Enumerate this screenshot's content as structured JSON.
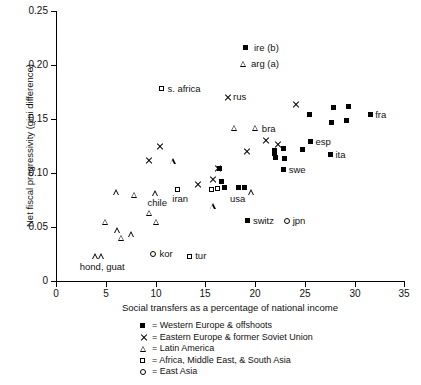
{
  "chart_data": {
    "type": "scatter",
    "title": "",
    "xlabel": "Social transfers as a percentage of national income",
    "ylabel": "Net fiscal progressivity (gini difference)",
    "xlim": [
      0,
      35
    ],
    "ylim": [
      0,
      0.25
    ],
    "xticks": [
      "0",
      "5",
      "10",
      "15",
      "20",
      "25",
      "30",
      "35"
    ],
    "yticks": [
      "0",
      "0.05",
      "0.10",
      "0.15",
      "0.20",
      "0.25"
    ],
    "grid": false,
    "legend_position": "below-axes",
    "series": [
      {
        "name": "Western Europe & offshoots",
        "marker": "filled-square",
        "points": [
          {
            "x": 16.6,
            "y": 0.092,
            "label": ""
          },
          {
            "x": 16.9,
            "y": 0.087,
            "label": ""
          },
          {
            "x": 18.4,
            "y": 0.087,
            "label": "usa"
          },
          {
            "x": 19.0,
            "y": 0.087,
            "label": ""
          },
          {
            "x": 16.4,
            "y": 0.104,
            "label": ""
          },
          {
            "x": 19.3,
            "y": 0.056,
            "label": "switz"
          },
          {
            "x": 22.0,
            "y": 0.118,
            "label": ""
          },
          {
            "x": 22.1,
            "y": 0.114,
            "label": ""
          },
          {
            "x": 22.0,
            "y": 0.121,
            "label": ""
          },
          {
            "x": 23.0,
            "y": 0.113,
            "label": ""
          },
          {
            "x": 22.9,
            "y": 0.123,
            "label": ""
          },
          {
            "x": 25.6,
            "y": 0.129,
            "label": "esp"
          },
          {
            "x": 24.8,
            "y": 0.122,
            "label": ""
          },
          {
            "x": 22.9,
            "y": 0.103,
            "label": "swe"
          },
          {
            "x": 27.6,
            "y": 0.117,
            "label": "ita"
          },
          {
            "x": 25.5,
            "y": 0.154,
            "label": ""
          },
          {
            "x": 27.9,
            "y": 0.161,
            "label": ""
          },
          {
            "x": 29.4,
            "y": 0.162,
            "label": ""
          },
          {
            "x": 27.7,
            "y": 0.147,
            "label": ""
          },
          {
            "x": 29.2,
            "y": 0.149,
            "label": ""
          },
          {
            "x": 31.6,
            "y": 0.154,
            "label": "fra"
          }
        ]
      },
      {
        "name": "Eastern Europe & former Soviet Union",
        "marker": "cross",
        "points": [
          {
            "x": 9.3,
            "y": 0.112,
            "label": ""
          },
          {
            "x": 10.4,
            "y": 0.125,
            "label": ""
          },
          {
            "x": 14.2,
            "y": 0.089,
            "label": ""
          },
          {
            "x": 15.7,
            "y": 0.094,
            "label": ""
          },
          {
            "x": 16.2,
            "y": 0.104,
            "label": ""
          },
          {
            "x": 17.2,
            "y": 0.17,
            "label": "rus"
          },
          {
            "x": 19.2,
            "y": 0.12,
            "label": ""
          },
          {
            "x": 21.1,
            "y": 0.13,
            "label": ""
          },
          {
            "x": 22.3,
            "y": 0.126,
            "label": ""
          },
          {
            "x": 24.1,
            "y": 0.163,
            "label": ""
          }
        ]
      },
      {
        "name": "Latin America",
        "marker": "open-triangle",
        "points": [
          {
            "x": 4.0,
            "y": 0.023,
            "label": "hond, guat"
          },
          {
            "x": 4.6,
            "y": 0.023,
            "label": ""
          },
          {
            "x": 5.0,
            "y": 0.055,
            "label": ""
          },
          {
            "x": 6.2,
            "y": 0.047,
            "label": ""
          },
          {
            "x": 6.6,
            "y": 0.04,
            "label": ""
          },
          {
            "x": 7.6,
            "y": 0.043,
            "label": ""
          },
          {
            "x": 6.1,
            "y": 0.082,
            "label": ""
          },
          {
            "x": 7.9,
            "y": 0.08,
            "label": ""
          },
          {
            "x": 9.4,
            "y": 0.063,
            "label": ""
          },
          {
            "x": 10.0,
            "y": 0.081,
            "label": "chile"
          },
          {
            "x": 10.1,
            "y": 0.055,
            "label": ""
          },
          {
            "x": 11.8,
            "y": 0.111,
            "label": ""
          },
          {
            "x": 15.8,
            "y": 0.069,
            "label": ""
          },
          {
            "x": 18.0,
            "y": 0.142,
            "label": ""
          },
          {
            "x": 20.1,
            "y": 0.142,
            "label": "bra"
          },
          {
            "x": 19.7,
            "y": 0.082,
            "label": ""
          }
        ]
      },
      {
        "name": "Africa, Middle East, & South Asia",
        "marker": "open-square",
        "points": [
          {
            "x": 12.2,
            "y": 0.085,
            "label": "iran"
          },
          {
            "x": 13.4,
            "y": 0.023,
            "label": "tur"
          },
          {
            "x": 15.6,
            "y": 0.085,
            "label": ""
          },
          {
            "x": 16.2,
            "y": 0.086,
            "label": ""
          },
          {
            "x": 10.6,
            "y": 0.178,
            "label": "s. africa"
          }
        ]
      },
      {
        "name": "East Asia",
        "marker": "open-circle",
        "points": [
          {
            "x": 9.8,
            "y": 0.025,
            "label": "kor"
          },
          {
            "x": 23.2,
            "y": 0.056,
            "label": "jpn"
          }
        ]
      }
    ],
    "annotations": [
      {
        "marker": "filled-square",
        "text": "ire (b)"
      },
      {
        "marker": "open-triangle",
        "text": "arg (a)"
      }
    ],
    "legend": [
      {
        "marker": "filled-square",
        "text": "= Western Europe & offshoots"
      },
      {
        "marker": "cross",
        "text": "= Eastern Europe & former Soviet Union"
      },
      {
        "marker": "open-triangle",
        "text": "= Latin America"
      },
      {
        "marker": "open-square",
        "text": "= Africa, Middle East, & South Asia"
      },
      {
        "marker": "open-circle",
        "text": "= East Asia"
      }
    ]
  }
}
